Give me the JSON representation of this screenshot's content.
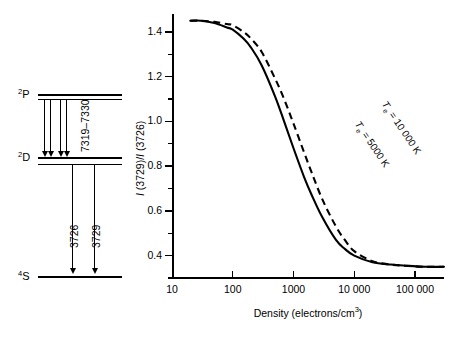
{
  "energy_diagram": {
    "name": "oxygen-ii-energy-level-diagram",
    "levels": [
      {
        "id": "p",
        "term": "P",
        "multiplicity": "2",
        "label": "2P",
        "y": 96,
        "doublet": true
      },
      {
        "id": "d",
        "term": "D",
        "multiplicity": "2",
        "label": "2D",
        "y": 159,
        "doublet": true
      },
      {
        "id": "s",
        "term": "S",
        "multiplicity": "4",
        "label": "4S",
        "y": 277,
        "doublet": false
      }
    ],
    "transitions": [
      {
        "id": "t7319",
        "label": "7319-7330",
        "display": "7319–7330",
        "from": "p",
        "to": "d",
        "rotated": true
      },
      {
        "id": "t3726",
        "label": "3726",
        "display": "3726",
        "from": "d",
        "to": "s",
        "rotated": true
      },
      {
        "id": "t3729",
        "label": "3729",
        "display": "3729",
        "from": "d",
        "to": "s",
        "rotated": true
      }
    ]
  },
  "chart_data": {
    "type": "line",
    "title": "",
    "xlabel": "Density (electrons/cm3)",
    "xlabel_base": "Density (electrons/cm",
    "xlabel_sup": "3",
    "xlabel_tail": ")",
    "ylabel": "I (3729)/I (3726)",
    "ylabel_parts": {
      "i1": "I",
      "n1": " (3729)/",
      "i2": "I",
      "n2": " (3726)"
    },
    "xscale": "log",
    "xlim": [
      10,
      300000
    ],
    "ylim": [
      0.3,
      1.48
    ],
    "grid": false,
    "legend_position": "inline-curve-labels",
    "xticks": [
      10,
      100,
      1000,
      10000,
      100000
    ],
    "xtick_labels": [
      "10",
      "100",
      "1000",
      "10 000",
      "100 000"
    ],
    "yticks_major": [
      0.4,
      0.6,
      0.8,
      1.0,
      1.2,
      1.4
    ],
    "ytick_labels": [
      "0.4",
      "0.6",
      "0.8",
      "1.0",
      "1.2",
      "1.4"
    ],
    "yticks_minor": [
      0.3,
      0.5,
      0.7,
      0.9,
      1.1,
      1.3
    ],
    "series": [
      {
        "name": "Te = 5000 K",
        "label_display": "T",
        "label_sub": "e",
        "label_rest": " = 5000 K",
        "style": "solid",
        "color": "#000000",
        "x": [
          20,
          30,
          50,
          80,
          100,
          150,
          200,
          300,
          500,
          700,
          1000,
          1500,
          2000,
          3000,
          5000,
          7000,
          10000,
          20000,
          40000,
          70000,
          150000,
          300000
        ],
        "y": [
          1.45,
          1.45,
          1.44,
          1.42,
          1.41,
          1.37,
          1.33,
          1.25,
          1.11,
          1.0,
          0.88,
          0.75,
          0.67,
          0.57,
          0.47,
          0.43,
          0.4,
          0.37,
          0.36,
          0.355,
          0.35,
          0.35
        ]
      },
      {
        "name": "Te = 10 000 K",
        "label_display": "T",
        "label_sub": "e",
        "label_rest": " = 10 000 K",
        "style": "dashed",
        "color": "#000000",
        "x": [
          20,
          30,
          50,
          80,
          100,
          150,
          200,
          300,
          500,
          700,
          1000,
          1500,
          2000,
          3000,
          5000,
          7000,
          10000,
          20000,
          40000,
          70000,
          150000,
          300000
        ],
        "y": [
          1.45,
          1.45,
          1.445,
          1.435,
          1.43,
          1.4,
          1.37,
          1.31,
          1.19,
          1.1,
          0.99,
          0.86,
          0.77,
          0.65,
          0.53,
          0.47,
          0.42,
          0.375,
          0.36,
          0.355,
          0.35,
          0.35
        ]
      }
    ]
  }
}
